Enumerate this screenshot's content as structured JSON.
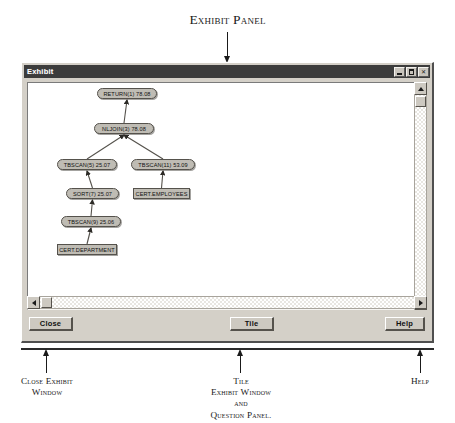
{
  "figure": {
    "title": "Exhibit Panel",
    "annotations": [
      {
        "id": "close",
        "lines": [
          "Close Exhibit",
          "Window"
        ]
      },
      {
        "id": "tile",
        "lines": [
          "Tile",
          "Exhibit Window",
          "and",
          "Question Panel."
        ]
      },
      {
        "id": "help",
        "lines": [
          "Help"
        ]
      }
    ]
  },
  "window": {
    "title": "Exhibit",
    "system_buttons": [
      {
        "name": "minimize",
        "glyph": "_"
      },
      {
        "name": "maximize",
        "glyph": "□"
      },
      {
        "name": "close",
        "glyph": "×"
      }
    ],
    "buttons": {
      "close": "Close",
      "tile": "Tile",
      "help": "Help"
    }
  },
  "plan_graph": {
    "nodes": [
      {
        "id": "return1",
        "label": "RETURN(1) 78.08",
        "shape": "op",
        "x": 69,
        "y": 5
      },
      {
        "id": "nljoin3",
        "label": "NLJOIN(3) 78.08",
        "shape": "op",
        "x": 66,
        "y": 40
      },
      {
        "id": "tbscan5",
        "label": "TBSCAN(5) 25.07",
        "shape": "op",
        "x": 29,
        "y": 76
      },
      {
        "id": "tbscan11",
        "label": "TBSCAN(11) 53.09",
        "shape": "op",
        "x": 103,
        "y": 76
      },
      {
        "id": "sort7",
        "label": "SORT(7) 25.07",
        "shape": "op",
        "x": 38,
        "y": 105
      },
      {
        "id": "certemp",
        "label": "CERT.EMPLOYEES",
        "shape": "tbl",
        "x": 105,
        "y": 105
      },
      {
        "id": "tbscan9",
        "label": "TBSCAN(9) 25.06",
        "shape": "op",
        "x": 33,
        "y": 133
      },
      {
        "id": "certdept",
        "label": "CERT.DEPARTMENT",
        "shape": "tbl",
        "x": 29,
        "y": 161
      }
    ],
    "edges": [
      {
        "from": "nljoin3",
        "to": "return1"
      },
      {
        "from": "tbscan5",
        "to": "nljoin3"
      },
      {
        "from": "tbscan11",
        "to": "nljoin3"
      },
      {
        "from": "sort7",
        "to": "tbscan5"
      },
      {
        "from": "certemp",
        "to": "tbscan11"
      },
      {
        "from": "tbscan9",
        "to": "sort7"
      },
      {
        "from": "certdept",
        "to": "tbscan9"
      }
    ]
  }
}
